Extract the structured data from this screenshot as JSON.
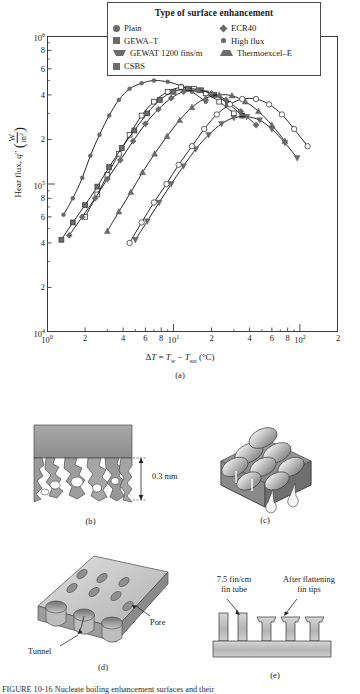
{
  "figure": {
    "panel_captions": {
      "a": "(a)",
      "b": "(b)",
      "c": "(c)",
      "d": "(d)",
      "e": "(e)"
    },
    "bottom_caption": "FIGURE 10-16   Nucleate boiling enhancement surfaces and their"
  },
  "chart_data": {
    "type": "scatter",
    "title": "",
    "xlabel": "ΔT = Tw − Tsat (°C)",
    "xlabel_parts": {
      "delta": "Δ",
      "t": "T",
      "eq": " = ",
      "tw": "T",
      "tw_sub": "w",
      "minus": " − ",
      "tsat": "T",
      "tsat_sub": "sat",
      "units": "(°C)"
    },
    "ylabel": "Hear flux, q″ (W/m²)",
    "ylabel_parts": {
      "text": "Hear flux, ",
      "sym": "q",
      "prime": "″",
      "num": "W",
      "den": "m",
      "den_sup": "2"
    },
    "xscale": "log",
    "yscale": "log",
    "xlim": [
      1,
      200
    ],
    "ylim": [
      10000,
      1000000
    ],
    "grid": false,
    "xticks": [
      {
        "value": 1,
        "label": "10",
        "sup": "0"
      },
      {
        "value": 2,
        "label": "2",
        "sup": ""
      },
      {
        "value": 4,
        "label": "4",
        "sup": ""
      },
      {
        "value": 6,
        "label": "6",
        "sup": ""
      },
      {
        "value": 8,
        "label": "8",
        "sup": ""
      },
      {
        "value": 10,
        "label": "10",
        "sup": "1"
      },
      {
        "value": 20,
        "label": "2",
        "sup": ""
      },
      {
        "value": 40,
        "label": "4",
        "sup": ""
      },
      {
        "value": 60,
        "label": "6",
        "sup": ""
      },
      {
        "value": 80,
        "label": "8",
        "sup": ""
      },
      {
        "value": 100,
        "label": "10",
        "sup": "2"
      },
      {
        "value": 200,
        "label": "2",
        "sup": ""
      }
    ],
    "xminor": [
      3,
      5,
      7,
      9,
      30,
      50,
      70,
      90
    ],
    "yticks": [
      {
        "value": 1000000,
        "label": "10",
        "sup": "6"
      },
      {
        "value": 800000,
        "label": "8",
        "sup": ""
      },
      {
        "value": 600000,
        "label": "6",
        "sup": ""
      },
      {
        "value": 400000,
        "label": "4",
        "sup": ""
      },
      {
        "value": 200000,
        "label": "2",
        "sup": ""
      },
      {
        "value": 100000,
        "label": "10",
        "sup": "5"
      },
      {
        "value": 80000,
        "label": "8",
        "sup": ""
      },
      {
        "value": 60000,
        "label": "6",
        "sup": ""
      },
      {
        "value": 40000,
        "label": "4",
        "sup": ""
      },
      {
        "value": 20000,
        "label": "2",
        "sup": ""
      },
      {
        "value": 10000,
        "label": "10",
        "sup": "4"
      }
    ],
    "yminor": [
      900000,
      700000,
      500000,
      300000,
      90000,
      70000,
      50000,
      30000
    ],
    "legend": {
      "title": "Type of surface enhancement",
      "position": "top-center",
      "columns": [
        [
          {
            "name": "Plain",
            "marker": "circle"
          },
          {
            "name": "GEWA–T",
            "marker": "square"
          },
          {
            "name": "GEWAT 1200 fins/m",
            "marker": "down-triangle"
          },
          {
            "name": "CSBS",
            "marker": "square"
          }
        ],
        [
          {
            "name": "ECR40",
            "marker": "diamond"
          },
          {
            "name": "High flux",
            "marker": "small-circle"
          },
          {
            "name": "Thermoexcel–E",
            "marker": "up-triangle"
          }
        ]
      ]
    },
    "series": [
      {
        "name": "High flux",
        "marker": "small-circle",
        "points": [
          [
            1.35,
            62000
          ],
          [
            1.6,
            80000
          ],
          [
            1.9,
            110000
          ],
          [
            2.2,
            155000
          ],
          [
            2.6,
            215000
          ],
          [
            3.1,
            290000
          ],
          [
            3.7,
            370000
          ],
          [
            4.5,
            440000
          ],
          [
            5.6,
            480000
          ],
          [
            7.0,
            500000
          ],
          [
            9.0,
            490000
          ],
          [
            11.5,
            460000
          ],
          [
            14.0,
            420000
          ],
          [
            18.0,
            360000
          ]
        ]
      },
      {
        "name": "CSBS",
        "marker": "square",
        "points": [
          [
            2.0,
            60000
          ],
          [
            2.5,
            85000
          ],
          [
            3.0,
            115000
          ],
          [
            3.7,
            160000
          ],
          [
            4.5,
            215000
          ],
          [
            5.6,
            290000
          ],
          [
            7.0,
            360000
          ],
          [
            9.0,
            420000
          ],
          [
            11.5,
            450000
          ],
          [
            14.5,
            440000
          ],
          [
            18.0,
            410000
          ],
          [
            23.0,
            360000
          ],
          [
            30.0,
            300000
          ]
        ]
      },
      {
        "name": "GEWA–T",
        "marker": "square-filled",
        "points": [
          [
            1.3,
            42000
          ],
          [
            1.6,
            55000
          ],
          [
            2.0,
            72000
          ],
          [
            2.5,
            96000
          ],
          [
            3.1,
            130000
          ],
          [
            3.9,
            175000
          ],
          [
            4.9,
            230000
          ],
          [
            6.2,
            300000
          ],
          [
            7.8,
            370000
          ],
          [
            10.0,
            420000
          ],
          [
            13.0,
            440000
          ],
          [
            16.5,
            430000
          ],
          [
            21.0,
            400000
          ],
          [
            27.0,
            350000
          ],
          [
            35.0,
            290000
          ]
        ]
      },
      {
        "name": "ECR40",
        "marker": "diamond",
        "points": [
          [
            1.5,
            45000
          ],
          [
            1.9,
            60000
          ],
          [
            2.4,
            80000
          ],
          [
            3.0,
            108000
          ],
          [
            3.8,
            145000
          ],
          [
            4.8,
            195000
          ],
          [
            6.0,
            255000
          ],
          [
            7.6,
            320000
          ],
          [
            9.6,
            380000
          ],
          [
            12.0,
            420000
          ],
          [
            15.5,
            430000
          ],
          [
            20.0,
            410000
          ],
          [
            26.0,
            370000
          ],
          [
            34.0,
            310000
          ],
          [
            45.0,
            250000
          ]
        ]
      },
      {
        "name": "Thermoexcel–E",
        "marker": "up-triangle",
        "points": [
          [
            3.0,
            48000
          ],
          [
            3.7,
            65000
          ],
          [
            4.6,
            88000
          ],
          [
            5.7,
            120000
          ],
          [
            7.1,
            160000
          ],
          [
            8.9,
            210000
          ],
          [
            11.2,
            270000
          ],
          [
            14.0,
            330000
          ],
          [
            18.0,
            380000
          ],
          [
            23.0,
            400000
          ],
          [
            29.0,
            395000
          ],
          [
            37.0,
            360000
          ],
          [
            47.0,
            310000
          ],
          [
            60.0,
            250000
          ],
          [
            76.0,
            195000
          ]
        ]
      },
      {
        "name": "GEWAT 1200 fins/m",
        "marker": "down-triangle",
        "points": [
          [
            5.0,
            42000
          ],
          [
            6.2,
            56000
          ],
          [
            7.7,
            75000
          ],
          [
            9.6,
            100000
          ],
          [
            12.0,
            132000
          ],
          [
            15.0,
            172000
          ],
          [
            19.0,
            215000
          ],
          [
            24.0,
            255000
          ],
          [
            30.0,
            280000
          ],
          [
            38.0,
            285000
          ],
          [
            48.0,
            270000
          ],
          [
            60.0,
            235000
          ],
          [
            76.0,
            190000
          ],
          [
            95.0,
            150000
          ]
        ]
      },
      {
        "name": "Plain",
        "marker": "circle-open",
        "points": [
          [
            4.5,
            40000
          ],
          [
            5.6,
            55000
          ],
          [
            7.0,
            75000
          ],
          [
            8.8,
            100000
          ],
          [
            11.0,
            135000
          ],
          [
            14.0,
            180000
          ],
          [
            17.5,
            235000
          ],
          [
            22.0,
            295000
          ],
          [
            28.0,
            345000
          ],
          [
            35.0,
            375000
          ],
          [
            45.0,
            375000
          ],
          [
            57.0,
            345000
          ],
          [
            72.0,
            295000
          ],
          [
            90.0,
            235000
          ],
          [
            115.0,
            180000
          ]
        ]
      }
    ],
    "stray_points": [
      [
        13.5,
        620000
      ],
      [
        27.0,
        560000
      ],
      [
        29.5,
        560000
      ]
    ]
  },
  "panel_b": {
    "caption": "(b)",
    "dimension_label": "0.3 mm",
    "description": "porous-coating-cross-section"
  },
  "panel_c": {
    "caption": "(c)",
    "description": "bubble-mound-enhanced-surface"
  },
  "panel_d": {
    "caption": "(d)",
    "labels": {
      "tunnel": "Tunnel",
      "pore": "Pore"
    }
  },
  "panel_e": {
    "caption": "(e)",
    "labels": {
      "fin_tube_line1": "7.5 fin/cm",
      "fin_tube_line2": "fin tube",
      "flatten_line1": "After flattening",
      "flatten_line2": "fin tips"
    }
  },
  "colors": {
    "marker_fill": "#6b6b6b",
    "curve": "#1f1f1f",
    "axis": "#3a3a3a",
    "metal_dark": "#8f8f8f",
    "metal_light": "#d4d4d4"
  }
}
